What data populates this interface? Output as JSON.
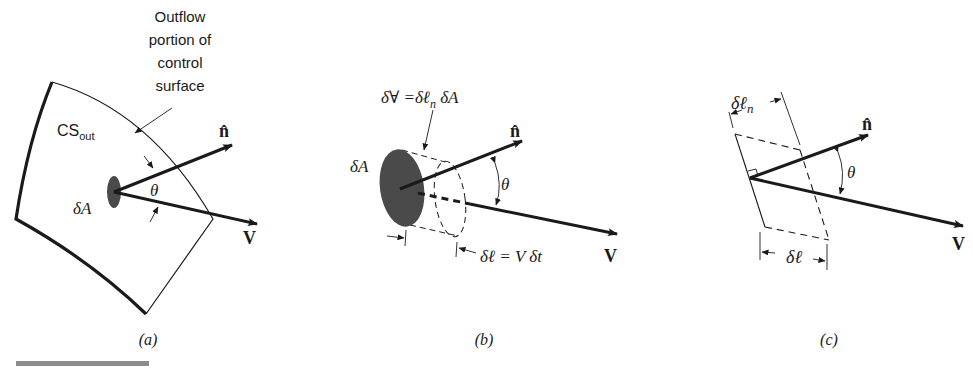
{
  "figure": {
    "panels": [
      {
        "id": "a",
        "caption": "(a)",
        "callout": [
          "Outflow",
          "portion of",
          "control",
          "surface"
        ],
        "surface_label_main": "CS",
        "surface_label_sub": "out",
        "area_label": "δA",
        "normal_label": "n̂",
        "velocity_label": "V",
        "angle_label": "θ"
      },
      {
        "id": "b",
        "caption": "(b)",
        "volume_equation": "δ∀ =δℓ",
        "volume_equation_sub": "n",
        "volume_equation_tail": " δA",
        "area_label": "δA",
        "normal_label": "n̂",
        "velocity_label": "V",
        "angle_label": "θ",
        "length_equation": "δℓ = V δt"
      },
      {
        "id": "c",
        "caption": "(c)",
        "normal_length_label": "δℓ",
        "normal_length_sub": "n",
        "length_label": "δℓ",
        "normal_label": "n̂",
        "velocity_label": "V",
        "angle_label": "θ"
      }
    ],
    "colors": {
      "ink": "#1a1a1a",
      "fill": "#4a4a4a",
      "rule": "#8c8c8c"
    }
  }
}
